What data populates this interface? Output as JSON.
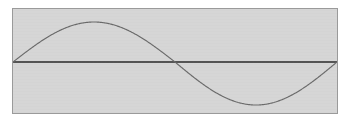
{
  "panel": {
    "background_color": "#d6d6d6",
    "border_color": "#9a9a9a",
    "x": 12,
    "y": 8,
    "width": 326,
    "height": 106
  },
  "canvas": {
    "background_color": "#ffffff",
    "width": 349,
    "height": 125
  },
  "axis": {
    "label": "zero axis",
    "color": "#555555",
    "y_pixel": 53,
    "x_start_pixel": 0,
    "x_end_pixel": 324
  },
  "chart_data": {
    "type": "line",
    "subtitle": "",
    "xlabel": "",
    "ylabel": "",
    "grid": false,
    "legend_position": "none",
    "xlim": [
      0,
      360
    ],
    "ylim": [
      -1,
      1
    ],
    "xtick_labels": [],
    "ytick_labels": [],
    "annotations": [],
    "series": [
      {
        "name": "sin(x)",
        "color": "#6a6a6a",
        "line_width": 1.15,
        "x": [
          0,
          10,
          20,
          30,
          40,
          50,
          60,
          70,
          80,
          90,
          100,
          110,
          120,
          130,
          140,
          150,
          160,
          170,
          180,
          190,
          200,
          210,
          220,
          230,
          240,
          250,
          260,
          270,
          280,
          290,
          300,
          310,
          320,
          330,
          340,
          350,
          360
        ],
        "values": [
          0.0,
          0.174,
          0.342,
          0.5,
          0.643,
          0.766,
          0.866,
          0.94,
          0.985,
          1.0,
          0.985,
          0.94,
          0.866,
          0.766,
          0.643,
          0.5,
          0.342,
          0.174,
          0.0,
          -0.174,
          -0.342,
          -0.5,
          -0.643,
          -0.766,
          -0.866,
          -0.94,
          -0.985,
          -1.0,
          -0.985,
          -0.94,
          -0.866,
          -0.766,
          -0.643,
          -0.5,
          -0.342,
          -0.174,
          0.0
        ]
      }
    ],
    "key_points": {
      "start": {
        "x": 0,
        "y": 0
      },
      "peak": {
        "x": 90,
        "y": 1
      },
      "zero_crossing": {
        "x": 180,
        "y": 0
      },
      "trough": {
        "x": 270,
        "y": -1
      },
      "end": {
        "x": 360,
        "y": 0
      }
    },
    "render_geometry": {
      "plot_left": 0,
      "plot_right": 324,
      "baseline_y": 53,
      "amplitude_up": 40,
      "amplitude_down": 43,
      "peak_x": 86,
      "crossing_x": 167,
      "trough_x": 251
    }
  }
}
